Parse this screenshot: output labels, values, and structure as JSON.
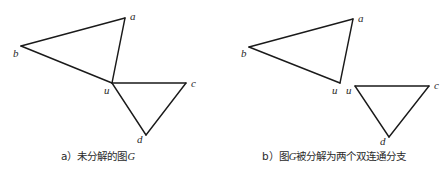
{
  "figures": [
    {
      "id": "a",
      "caption": "a）未分解的图G",
      "vertices": {
        "a": {
          "x": 125,
          "y": 18,
          "label": "a",
          "lx": 130,
          "ly": 20
        },
        "b": {
          "x": 21,
          "y": 46,
          "label": "b",
          "lx": 13,
          "ly": 57
        },
        "u": {
          "x": 112,
          "y": 83,
          "label": "u",
          "lx": 104,
          "ly": 94
        },
        "c": {
          "x": 186,
          "y": 83,
          "label": "c",
          "lx": 191,
          "ly": 87
        },
        "d": {
          "x": 146,
          "y": 135,
          "label": "d",
          "lx": 137,
          "ly": 143
        }
      },
      "edges": [
        [
          "a",
          "b"
        ],
        [
          "b",
          "u"
        ],
        [
          "u",
          "a"
        ],
        [
          "u",
          "c"
        ],
        [
          "c",
          "d"
        ],
        [
          "d",
          "u"
        ]
      ]
    },
    {
      "id": "b",
      "caption": "b）图G被分解为两个双连通分支",
      "vertices": {
        "a": {
          "x": 353,
          "y": 19,
          "label": "a",
          "lx": 358,
          "ly": 22
        },
        "b": {
          "x": 249,
          "y": 47,
          "label": "b",
          "lx": 241,
          "ly": 57
        },
        "u1": {
          "x": 340,
          "y": 83,
          "label": "u",
          "lx": 332,
          "ly": 94
        },
        "u2": {
          "x": 355,
          "y": 86,
          "label": "u",
          "lx": 346,
          "ly": 94
        },
        "c": {
          "x": 429,
          "y": 86,
          "label": "c",
          "lx": 434,
          "ly": 89
        },
        "d": {
          "x": 389,
          "y": 137,
          "label": "d",
          "lx": 380,
          "ly": 145
        }
      },
      "edges": [
        [
          "a",
          "b"
        ],
        [
          "b",
          "u1"
        ],
        [
          "u1",
          "a"
        ],
        [
          "u2",
          "c"
        ],
        [
          "c",
          "d"
        ],
        [
          "d",
          "u2"
        ]
      ]
    }
  ],
  "labels": {
    "fig_a": {
      "prefix": "a）未分解的图",
      "var": "G"
    },
    "fig_b": {
      "prefix": "b）图",
      "var": "G",
      "suffix": "被分解为两个双连通分支"
    }
  }
}
